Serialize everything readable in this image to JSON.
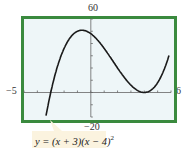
{
  "chart_data": {
    "type": "line",
    "title": "",
    "function_label": "y = (x + 3)(x − 4)^2",
    "function_label_parts": {
      "prefix": "y = (x + 3)(x − 4)",
      "exponent": "2"
    },
    "xlabel": "",
    "ylabel": "",
    "xlim": [
      -5,
      6
    ],
    "ylim": [
      -20,
      60
    ],
    "window_labels": {
      "ymax": "60",
      "ymin": "−20",
      "xmin": "−5",
      "xmax": "6"
    },
    "x_ticks": [
      -5,
      -4,
      -3,
      -2,
      -1,
      0,
      1,
      2,
      3,
      4,
      5,
      6
    ],
    "y_ticks": [
      -20,
      -10,
      0,
      10,
      20,
      30,
      40,
      50,
      60
    ],
    "grid": false,
    "legend": "none",
    "series": [
      {
        "name": "y = (x + 3)(x − 4)^2",
        "x": [
          -3.4,
          -3.2,
          -3.0,
          -2.8,
          -2.6,
          -2.4,
          -2.2,
          -2.0,
          -1.8,
          -1.6,
          -1.4,
          -1.2,
          -1.0,
          -0.8,
          -0.6,
          -0.4,
          -0.2,
          0.0,
          0.2,
          0.4,
          0.6,
          0.8,
          1.0,
          1.2,
          1.4,
          1.6,
          1.8,
          2.0,
          2.2,
          2.4,
          2.6,
          2.8,
          3.0,
          3.2,
          3.4,
          3.6,
          3.8,
          4.0,
          4.2,
          4.4,
          4.6,
          4.8,
          5.0,
          5.2,
          5.4,
          5.6,
          5.8
        ],
        "y": [
          -21.06,
          -10.24,
          0.0,
          9.65,
          18.72,
          27.23,
          35.19,
          42.0,
          48.55,
          54.17,
          58.46,
          62.02,
          64.0,
          64.8,
          64.26,
          62.57,
          60.18,
          48.0,
          50.86,
          44.93,
          41.62,
          36.86,
          36.0,
          29.79,
          25.74,
          22.46,
          17.18,
          20.0,
          10.53,
          11.01,
          10.54,
          3.3,
          6.0,
          3.93,
          2.3,
          1.06,
          0.27,
          0.0,
          0.29,
          1.18,
          2.74,
          5.06,
          8.0,
          12.1,
          16.99,
          22.78,
          29.48
        ]
      }
    ]
  },
  "colors": {
    "frame": "#3a8a3e",
    "plot_bg": "#eef6f8",
    "curve": "#1a1a1a",
    "axis": "#666666",
    "callout_bg": "#fbf3df"
  }
}
